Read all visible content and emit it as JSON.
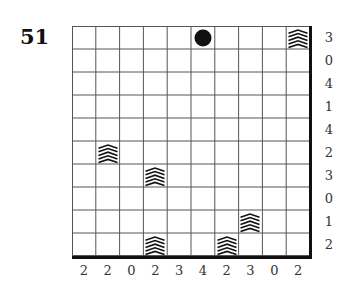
{
  "puzzle": {
    "number": "51",
    "rows": 10,
    "cols": 10,
    "row_clues": [
      "3",
      "0",
      "4",
      "1",
      "4",
      "2",
      "3",
      "0",
      "1",
      "2"
    ],
    "col_clues": [
      "2",
      "2",
      "0",
      "2",
      "3",
      "4",
      "2",
      "3",
      "0",
      "2"
    ],
    "items": [
      {
        "type": "circle",
        "row": 0,
        "col": 5,
        "icon": "filled-circle-icon"
      },
      {
        "type": "chevron",
        "row": 0,
        "col": 9,
        "icon": "chevron-stack-icon"
      },
      {
        "type": "chevron",
        "row": 5,
        "col": 1,
        "icon": "chevron-stack-icon"
      },
      {
        "type": "chevron",
        "row": 6,
        "col": 3,
        "icon": "chevron-stack-icon"
      },
      {
        "type": "chevron",
        "row": 8,
        "col": 7,
        "icon": "chevron-stack-icon"
      },
      {
        "type": "chevron",
        "row": 9,
        "col": 3,
        "icon": "chevron-stack-icon"
      },
      {
        "type": "chevron",
        "row": 9,
        "col": 6,
        "icon": "chevron-stack-icon"
      }
    ],
    "colors": {
      "grid_line": "#555555",
      "frame": "#111111",
      "ink": "#111111",
      "label": "#333333"
    }
  }
}
